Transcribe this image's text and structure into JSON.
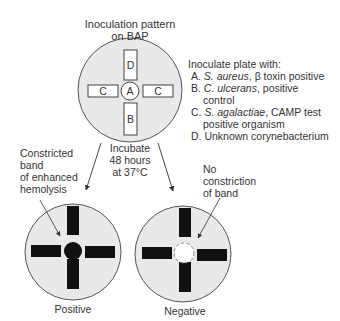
{
  "title": {
    "line1": "Inoculation pattern",
    "line2": "on BAP"
  },
  "plate_labels": {
    "top": "D",
    "left": "C",
    "center": "A",
    "right": "C",
    "bottom": "B"
  },
  "legend": {
    "heading": "Inoculate plate with:",
    "items": [
      {
        "letter": "A.",
        "organism": "S. aureus",
        "rest": ", β toxin positive",
        "cont": ""
      },
      {
        "letter": "B.",
        "organism": "C. ulcerans",
        "rest": ", positive",
        "cont": "control"
      },
      {
        "letter": "C.",
        "organism": "S. agalactiae",
        "rest": ", CAMP test",
        "cont": "positive organism"
      },
      {
        "letter": "D.",
        "organism": "",
        "rest": "Unknown corynebacterium",
        "cont": ""
      }
    ]
  },
  "incubate": {
    "line1": "Incubate",
    "line2": "48 hours",
    "line3": "at 37°C"
  },
  "positive_note": {
    "line1": "Constricted",
    "line2": "band",
    "line3": "of enhanced",
    "line4": "hemolysis"
  },
  "negative_note": {
    "line1": "No",
    "line2": "constriction",
    "line3": "of band"
  },
  "results": {
    "positive_label": "Positive",
    "negative_label": "Negative"
  },
  "colors": {
    "plate_fill": "#e9e9e9",
    "plate_stroke": "#555555",
    "streak": "#111111"
  }
}
